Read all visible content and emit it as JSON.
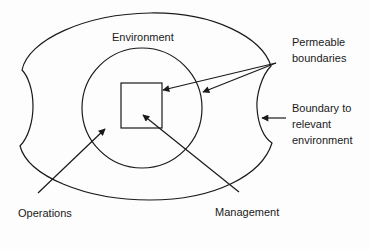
{
  "diagram": {
    "type": "organization-environment-boundaries",
    "colors": {
      "background": "#fdfdfd",
      "stroke": "#1a1a1a",
      "text": "#1a1a1a"
    },
    "labels": {
      "environment": "Environment",
      "permeable_line1": "Permeable",
      "permeable_line2": "boundaries",
      "boundary_line1": "Boundary to",
      "boundary_line2": "relevant",
      "boundary_line3": "environment",
      "operations": "Operations",
      "management": "Management"
    },
    "shapes": [
      {
        "name": "relevant-environment-boundary",
        "kind": "outer-blob"
      },
      {
        "name": "operations-circle",
        "kind": "circle"
      },
      {
        "name": "management-square",
        "kind": "square"
      }
    ],
    "arrows": [
      {
        "from": "Permeable boundaries",
        "to": "management-square"
      },
      {
        "from": "Permeable boundaries",
        "to": "operations-circle"
      },
      {
        "from": "Boundary to relevant environment",
        "to": "relevant-environment-boundary"
      },
      {
        "from": "Operations",
        "to": "operations-circle"
      },
      {
        "from": "Management",
        "to": "management-square"
      }
    ]
  }
}
